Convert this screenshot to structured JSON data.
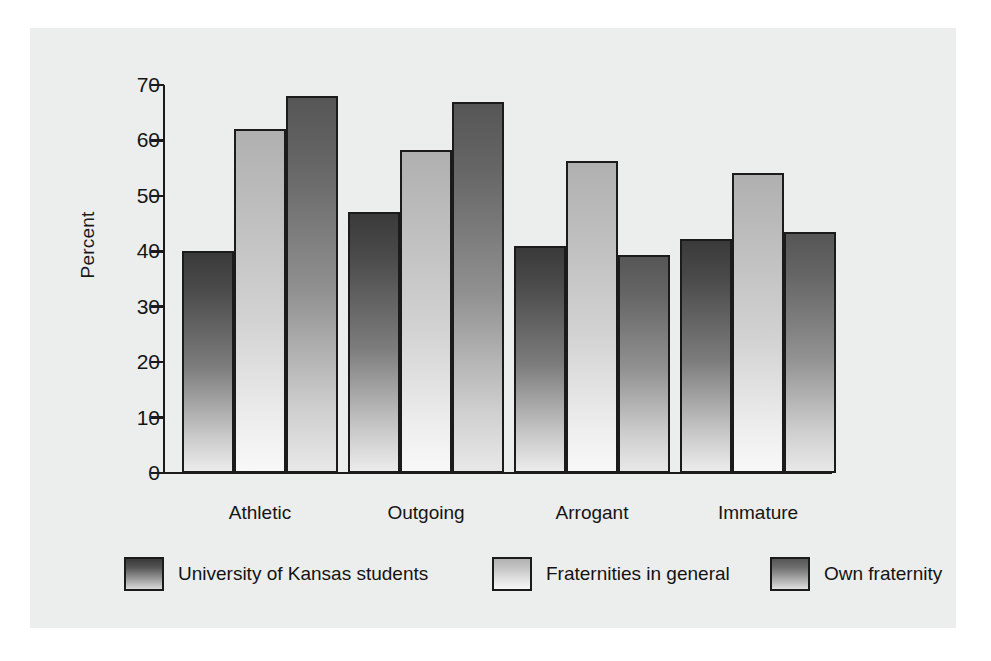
{
  "chart_data": {
    "type": "bar",
    "title": "",
    "subtitle": "",
    "xlabel": "",
    "ylabel": "Percent",
    "ylim": [
      0,
      70
    ],
    "yticks": [
      0,
      10,
      20,
      30,
      40,
      50,
      60,
      70
    ],
    "ytick_labels": [
      "0",
      "10",
      "20",
      "30",
      "40",
      "50",
      "60",
      "70"
    ],
    "grid": false,
    "legend_position": "bottom",
    "categories": [
      "Athletic",
      "Outgoing",
      "Arrogant",
      "Immature"
    ],
    "series": [
      {
        "name": "University of Kansas students",
        "color": "#3a3a3a",
        "values": [
          40.0,
          47.0,
          41.0,
          42.3
        ]
      },
      {
        "name": "Fraternities in general",
        "color": "#b0b0b0",
        "values": [
          62.0,
          58.3,
          56.3,
          54.2
        ]
      },
      {
        "name": "Own fraternity",
        "color": "#565656",
        "values": [
          68.0,
          67.0,
          39.3,
          43.4
        ]
      }
    ]
  },
  "axis": {
    "y_title": "Percent"
  },
  "legend": {
    "entries": [
      {
        "label": "University of Kansas students"
      },
      {
        "label": "Fraternities in general"
      },
      {
        "label": "Own fraternity"
      }
    ]
  },
  "colors": {
    "page_background": "#ffffff",
    "panel_background": "#eceeed",
    "axis_line": "#1b1b1b",
    "text": "#151515"
  }
}
